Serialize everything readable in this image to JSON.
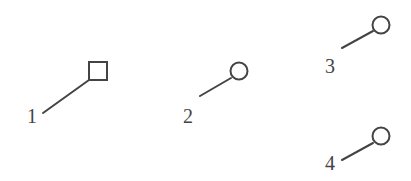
{
  "diagram": {
    "stroke_color": "#444444",
    "background": "#ffffff",
    "items": [
      {
        "label": "1",
        "marker": "square",
        "marker_icon": "square-outline-icon",
        "label_pos": [
          27,
          106
        ],
        "line": [
          43,
          113,
          89,
          80
        ],
        "marker_geom": {
          "x": 89,
          "y": 62,
          "w": 18,
          "h": 18
        }
      },
      {
        "label": "2",
        "marker": "circle",
        "marker_icon": "circle-outline-icon",
        "label_pos": [
          183,
          106
        ],
        "line": [
          200,
          96,
          231,
          78
        ],
        "marker_geom": {
          "cx": 239,
          "cy": 71,
          "r": 8.5
        }
      },
      {
        "label": "3",
        "marker": "circle",
        "marker_icon": "circle-outline-icon",
        "label_pos": [
          325,
          56
        ],
        "line": [
          342,
          48,
          373,
          31
        ],
        "marker_geom": {
          "cx": 381,
          "cy": 25,
          "r": 8.5
        }
      },
      {
        "label": "4",
        "marker": "circle",
        "marker_icon": "circle-outline-icon",
        "label_pos": [
          325,
          153
        ],
        "line": [
          342,
          160,
          373,
          143
        ],
        "marker_geom": {
          "cx": 381,
          "cy": 136,
          "r": 8.5
        }
      }
    ]
  }
}
